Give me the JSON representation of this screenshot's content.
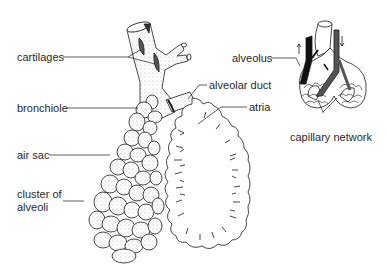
{
  "diagram": {
    "type": "anatomical-illustration",
    "labels": {
      "cartilages": "cartilages",
      "bronchiole": "bronchiole",
      "air_sac": "air sac",
      "cluster_line1": "cluster of",
      "cluster_line2": "alveoli",
      "alveolar_duct": "alveolar duct",
      "atria": "atria",
      "alveolus": "alveolus",
      "capillary_network": "capillary network"
    },
    "colors": {
      "ink": "#1a1a1a",
      "label": "#2a2a2a",
      "vessel_dark": "#111111",
      "vessel_gray": "#555555",
      "background": "#ffffff"
    }
  }
}
